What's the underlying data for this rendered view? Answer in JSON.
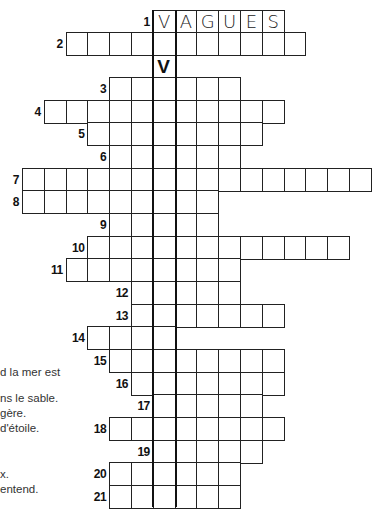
{
  "puzzle": {
    "title_word": "VAGUES",
    "vertical_key_letter": "V",
    "grid": {
      "origin_x": 22,
      "cell_w": 21.8,
      "cell_h": 22.6,
      "highlight_col": 6,
      "highlight_top_y": 10,
      "highlight_bottom_y": 507
    },
    "rows": [
      {
        "num": "1",
        "y": 10,
        "start_col": 6,
        "end_col": 11,
        "letters": [
          "V",
          "A",
          "G",
          "U",
          "E",
          "S"
        ]
      },
      {
        "num": "2",
        "y": 32,
        "start_col": 2,
        "end_col": 12,
        "letters": []
      },
      {
        "num": "3",
        "y": 77,
        "start_col": 4,
        "end_col": 9,
        "letters": []
      },
      {
        "num": "4",
        "y": 100,
        "start_col": 1,
        "end_col": 11,
        "letters": []
      },
      {
        "num": "5",
        "y": 122,
        "start_col": 3,
        "end_col": 10,
        "letters": []
      },
      {
        "num": "6",
        "y": 145,
        "start_col": 4,
        "end_col": 9,
        "letters": []
      },
      {
        "num": "7",
        "y": 168,
        "start_col": 0,
        "end_col": 15,
        "letters": []
      },
      {
        "num": "8",
        "y": 190,
        "start_col": 0,
        "end_col": 8,
        "letters": []
      },
      {
        "num": "9",
        "y": 213,
        "start_col": 4,
        "end_col": 8,
        "letters": []
      },
      {
        "num": "10",
        "y": 236,
        "start_col": 3,
        "end_col": 14,
        "letters": []
      },
      {
        "num": "11",
        "y": 258,
        "start_col": 2,
        "end_col": 9,
        "letters": []
      },
      {
        "num": "12",
        "y": 281,
        "start_col": 5,
        "end_col": 9,
        "letters": []
      },
      {
        "num": "13",
        "y": 304,
        "start_col": 5,
        "end_col": 11,
        "letters": []
      },
      {
        "num": "14",
        "y": 326,
        "start_col": 3,
        "end_col": 6,
        "letters": []
      },
      {
        "num": "15",
        "y": 349,
        "start_col": 4,
        "end_col": 11,
        "letters": []
      },
      {
        "num": "16",
        "y": 372,
        "start_col": 5,
        "end_col": 11,
        "letters": []
      },
      {
        "num": "17",
        "y": 394,
        "start_col": 6,
        "end_col": 10,
        "letters": []
      },
      {
        "num": "18",
        "y": 417,
        "start_col": 4,
        "end_col": 11,
        "letters": []
      },
      {
        "num": "19",
        "y": 440,
        "start_col": 6,
        "end_col": 10,
        "letters": []
      },
      {
        "num": "20",
        "y": 462,
        "start_col": 4,
        "end_col": 9,
        "letters": []
      },
      {
        "num": "21",
        "y": 485,
        "start_col": 4,
        "end_col": 9,
        "letters": []
      }
    ],
    "v_marker": {
      "y": 55,
      "col": 6,
      "text": "V"
    }
  },
  "clues_partial": [
    {
      "y": 366,
      "text": "d la mer est"
    },
    {
      "y": 392,
      "text": "ns le sable."
    },
    {
      "y": 407,
      "text": "gère."
    },
    {
      "y": 422,
      "text": "d'étoile."
    },
    {
      "y": 468,
      "text": "x."
    },
    {
      "y": 483,
      "text": "entend."
    }
  ]
}
